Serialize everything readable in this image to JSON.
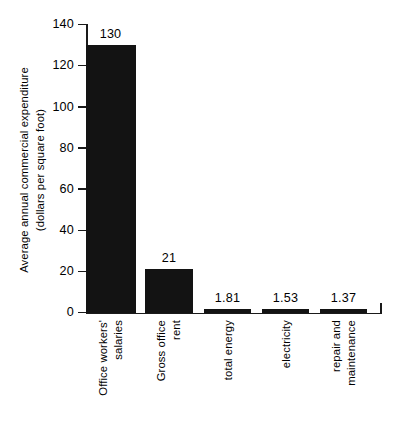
{
  "chart_data": {
    "type": "bar",
    "title": "",
    "subtitle": "",
    "xlabel": "",
    "ylabel": "Average annual commercial expenditure (dollars per square foot)",
    "ylabel_line1": "Average annual commercial expenditure",
    "ylabel_line2": "(dollars per square foot)",
    "ylim": [
      0,
      140
    ],
    "yticks": [
      0,
      20,
      40,
      60,
      80,
      100,
      120,
      140
    ],
    "ytick_labels": [
      "0",
      "20",
      "40",
      "60",
      "80",
      "100",
      "120",
      "140"
    ],
    "grid": false,
    "legend": null,
    "bar_color": "#131313",
    "axis_color": "#1a1a1a",
    "background_color": "#ffffff",
    "categories": [
      "Office workers' salaries",
      "Gross office rent",
      "total energy",
      "electricity",
      "repair and maintenance"
    ],
    "category_lines": [
      [
        "Office workers'",
        "salaries"
      ],
      [
        "Gross office",
        "rent"
      ],
      [
        "total energy"
      ],
      [
        "electricity"
      ],
      [
        "repair and",
        "maintenance"
      ]
    ],
    "values": [
      130,
      21,
      1.81,
      1.53,
      1.37
    ],
    "value_labels": [
      "130",
      "21",
      "1.81",
      "1.53",
      "1.37"
    ]
  }
}
